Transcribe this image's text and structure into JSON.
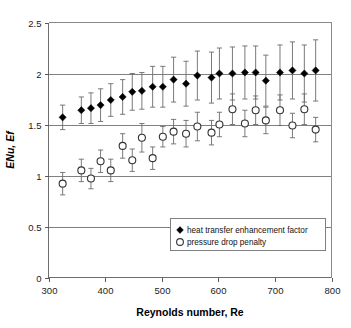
{
  "chart_data": {
    "type": "scatter",
    "title": "",
    "xlabel": "Reynolds number, Re",
    "ylabel": "ENu, Ef",
    "xlim": [
      300,
      800
    ],
    "ylim": [
      0,
      2.5
    ],
    "xticks": [
      300,
      400,
      500,
      600,
      700,
      800
    ],
    "yticks": [
      0,
      0.5,
      1,
      1.5,
      2,
      2.5
    ],
    "xtick_labels": [
      "300",
      "400",
      "500",
      "600",
      "700",
      "800"
    ],
    "ytick_labels": [
      "0",
      "0.5",
      "1",
      "1.5",
      "2",
      "2.5"
    ],
    "grid": "horizontal",
    "gridlines_y": [
      0.5,
      1,
      1.5,
      2
    ],
    "legend_position": "bottom-right",
    "errorbars": true,
    "series": [
      {
        "name": "heat transfer enhancement factor",
        "marker": "filled-diamond",
        "color": "#000000",
        "x": [
          325,
          358,
          375,
          392,
          410,
          431,
          448,
          465,
          484,
          502,
          521,
          543,
          563,
          588,
          602,
          625,
          647,
          666,
          684,
          709,
          731,
          752,
          772
        ],
        "y": [
          1.57,
          1.64,
          1.66,
          1.69,
          1.74,
          1.77,
          1.82,
          1.83,
          1.87,
          1.87,
          1.94,
          1.9,
          1.98,
          1.96,
          2.0,
          2.0,
          2.01,
          2.01,
          1.93,
          2.01,
          2.03,
          2.0,
          2.03
        ],
        "yerr_lower": [
          0.12,
          0.13,
          0.15,
          0.16,
          0.16,
          0.17,
          0.18,
          0.18,
          0.2,
          0.2,
          0.22,
          0.22,
          0.24,
          0.25,
          0.25,
          0.26,
          0.26,
          0.26,
          0.25,
          0.27,
          0.28,
          0.28,
          0.3
        ],
        "yerr_upper": [
          0.12,
          0.13,
          0.15,
          0.16,
          0.16,
          0.17,
          0.18,
          0.18,
          0.2,
          0.2,
          0.22,
          0.22,
          0.24,
          0.25,
          0.25,
          0.26,
          0.26,
          0.26,
          0.25,
          0.27,
          0.28,
          0.28,
          0.3
        ]
      },
      {
        "name": "pressure drop penalty",
        "marker": "open-circle",
        "color": "#ffffff",
        "x": [
          325,
          358,
          375,
          392,
          410,
          431,
          448,
          465,
          484,
          502,
          521,
          543,
          563,
          588,
          602,
          625,
          647,
          666,
          684,
          709,
          731,
          752,
          772
        ],
        "y": [
          0.92,
          1.05,
          0.97,
          1.14,
          1.05,
          1.29,
          1.15,
          1.37,
          1.17,
          1.38,
          1.43,
          1.41,
          1.48,
          1.42,
          1.5,
          1.65,
          1.51,
          1.64,
          1.54,
          1.64,
          1.49,
          1.65,
          1.45
        ],
        "yerr_lower": [
          0.11,
          0.11,
          0.1,
          0.11,
          0.11,
          0.12,
          0.11,
          0.14,
          0.11,
          0.1,
          0.12,
          0.13,
          0.14,
          0.12,
          0.12,
          0.15,
          0.13,
          0.14,
          0.13,
          0.15,
          0.12,
          0.15,
          0.12
        ],
        "yerr_upper": [
          0.11,
          0.11,
          0.1,
          0.11,
          0.11,
          0.12,
          0.11,
          0.14,
          0.11,
          0.1,
          0.12,
          0.13,
          0.14,
          0.12,
          0.12,
          0.15,
          0.13,
          0.14,
          0.13,
          0.15,
          0.12,
          0.15,
          0.12
        ]
      }
    ]
  },
  "legend": {
    "entries": [
      {
        "label": "heat transfer enhancement factor",
        "marker": "filled-diamond"
      },
      {
        "label": "pressure drop penalty",
        "marker": "open-circle"
      }
    ]
  }
}
